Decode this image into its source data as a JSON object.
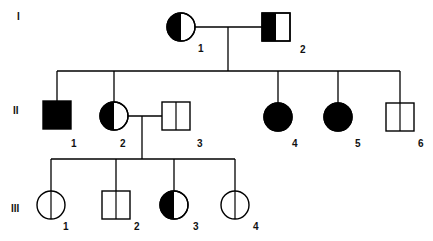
{
  "colors": {
    "affected": "#000000",
    "unaffected": "#ffffff",
    "line": "#000000"
  },
  "legend_semantics": {
    "full-fill": "affected",
    "half-fill": "carrier / partially affected",
    "center-line": "unaffected (divided symbol)"
  },
  "generations": [
    {
      "label": "I",
      "x": 17,
      "y": 20
    },
    {
      "label": "II",
      "x": 13,
      "y": 114
    },
    {
      "label": "III",
      "x": 11,
      "y": 212
    }
  ],
  "individuals": [
    {
      "id": "I-1",
      "generation": "I",
      "number": "1",
      "sex": "female",
      "status": "half-left",
      "cx": 181,
      "cy": 27,
      "label_x": 198,
      "label_y": 52
    },
    {
      "id": "I-2",
      "generation": "I",
      "number": "2",
      "sex": "male",
      "status": "half-left",
      "cx": 276,
      "cy": 27,
      "label_x": 300,
      "label_y": 53
    },
    {
      "id": "II-1",
      "generation": "II",
      "number": "1",
      "sex": "male",
      "status": "affected",
      "cx": 57,
      "cy": 115,
      "label_x": 71,
      "label_y": 147
    },
    {
      "id": "II-2",
      "generation": "II",
      "number": "2",
      "sex": "female",
      "status": "half-left",
      "cx": 114,
      "cy": 116,
      "label_x": 120,
      "label_y": 147
    },
    {
      "id": "II-3",
      "generation": "II",
      "number": "3",
      "sex": "male",
      "status": "divided",
      "cx": 176,
      "cy": 116,
      "label_x": 197,
      "label_y": 147
    },
    {
      "id": "II-4",
      "generation": "II",
      "number": "4",
      "sex": "female",
      "status": "affected",
      "cx": 278,
      "cy": 117,
      "label_x": 292,
      "label_y": 147
    },
    {
      "id": "II-5",
      "generation": "II",
      "number": "5",
      "sex": "female",
      "status": "affected",
      "cx": 338,
      "cy": 117,
      "label_x": 355,
      "label_y": 147
    },
    {
      "id": "II-6",
      "generation": "II",
      "number": "6",
      "sex": "male",
      "status": "divided",
      "cx": 400,
      "cy": 117,
      "label_x": 418,
      "label_y": 147
    },
    {
      "id": "III-1",
      "generation": "III",
      "number": "1",
      "sex": "female",
      "status": "divided",
      "cx": 51,
      "cy": 205,
      "label_x": 63,
      "label_y": 230
    },
    {
      "id": "III-2",
      "generation": "III",
      "number": "2",
      "sex": "male",
      "status": "divided",
      "cx": 116,
      "cy": 205,
      "label_x": 134,
      "label_y": 230
    },
    {
      "id": "III-3",
      "generation": "III",
      "number": "3",
      "sex": "female",
      "status": "half-left",
      "cx": 174,
      "cy": 205,
      "label_x": 193,
      "label_y": 230
    },
    {
      "id": "III-4",
      "generation": "III",
      "number": "4",
      "sex": "female",
      "status": "divided",
      "cx": 235,
      "cy": 205,
      "label_x": 253,
      "label_y": 230
    }
  ],
  "relationships": {
    "matings": [
      {
        "partners": [
          "I-1",
          "I-2"
        ],
        "y": 27,
        "x1": 195,
        "x2": 262,
        "descent_x": 228,
        "sibship_y": 71
      },
      {
        "partners": [
          "II-2",
          "II-3"
        ],
        "y": 116,
        "x1": 128,
        "x2": 162,
        "descent_x": 142,
        "sibship_y": 159
      }
    ],
    "sibships": [
      {
        "parents": "I-1 x I-2",
        "children": [
          "II-1",
          "II-2",
          "II-4",
          "II-5",
          "II-6"
        ],
        "y": 71,
        "x1": 57,
        "x2": 400
      },
      {
        "parents": "II-2 x II-3",
        "children": [
          "III-1",
          "III-2",
          "III-3",
          "III-4"
        ],
        "y": 159,
        "x1": 51,
        "x2": 235
      }
    ]
  },
  "symbol_size": 28
}
